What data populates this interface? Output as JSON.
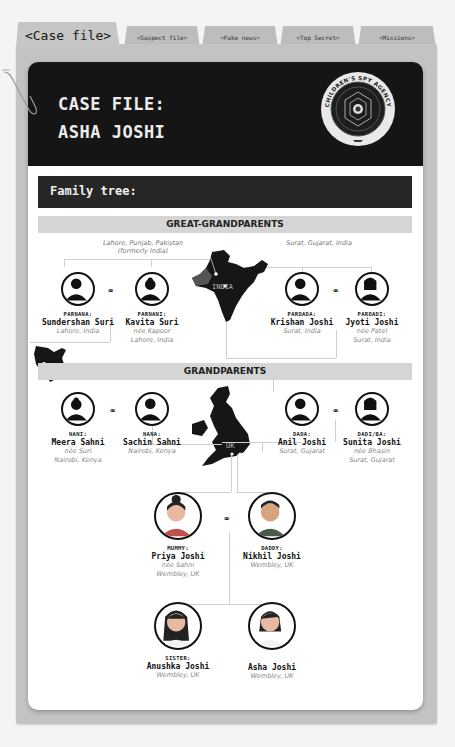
{
  "tabs": [
    {
      "label": "<Case file>",
      "active": true
    },
    {
      "label": "<Suspect file>",
      "active": false
    },
    {
      "label": "<Fake news>",
      "active": false
    },
    {
      "label": "<Top Secret>",
      "active": false
    },
    {
      "label": "<Missions>",
      "active": false
    }
  ],
  "header": {
    "line1": "CASE FILE:",
    "line2": "ASHA JOSHI",
    "badge_top_text": "CHILDREN'S SPY AGENCY",
    "badge_bottom_left": "QUESTION",
    "badge_bottom_right": "EVERYTHING"
  },
  "section_title": "Family tree:",
  "generations": {
    "great_grandparents": "GREAT-GRANDPARENTS",
    "grandparents": "GRANDPARENTS"
  },
  "origins": {
    "suri_great": "Lahore, Punjab, Pakistan",
    "suri_great_note": "(formerly India)",
    "joshi_great": "Surat, Gujarat, India"
  },
  "maps": {
    "india": "INDIA",
    "uk": "UK",
    "kenya": ""
  },
  "people": {
    "parnana": {
      "role": "PARNANA:",
      "name": "Sundershan Suri",
      "lines": [
        "Lahore, India"
      ]
    },
    "parnani": {
      "role": "PARNANI:",
      "name": "Kavita Suri",
      "lines": [
        "née Kapoor",
        "Lahore, India"
      ]
    },
    "pardada": {
      "role": "PARDADA:",
      "name": "Krishan Joshi",
      "lines": [
        "Surat, India"
      ]
    },
    "pardadi": {
      "role": "PARDADI:",
      "name": "Jyoti Joshi",
      "lines": [
        "née Patel",
        "Surat, India"
      ]
    },
    "nani": {
      "role": "NANI:",
      "name": "Meera Sahni",
      "lines": [
        "née Suri",
        "Nairobi, Kenya"
      ]
    },
    "nana": {
      "role": "NANA:",
      "name": "Sachin Sahni",
      "lines": [
        "Nairobi, Kenya"
      ]
    },
    "dada": {
      "role": "DADA:",
      "name": "Anil Joshi",
      "lines": [
        "Surat, Gujarat"
      ]
    },
    "dadi": {
      "role": "DADI/BA:",
      "name": "Sunita Joshi",
      "lines": [
        "née Bhasin",
        "Surat, Gujarat"
      ]
    },
    "mummy": {
      "role": "MUMMY:",
      "name": "Priya Joshi",
      "lines": [
        "née Sahni",
        "Wembley, UK"
      ]
    },
    "daddy": {
      "role": "DADDY:",
      "name": "Nikhil Joshi",
      "lines": [
        "Wembley, UK"
      ]
    },
    "sister": {
      "role": "SISTER:",
      "name": "Anushka Joshi",
      "lines": [
        "Wembley, UK"
      ]
    },
    "self": {
      "role": "",
      "name": "Asha Joshi",
      "lines": [
        "Wembley, UK"
      ]
    }
  },
  "marriage_symbol": "⚭",
  "colors": {
    "header_bg": "#151515",
    "folder_bg": "#c3c3c1",
    "gen_bar": "#d5d5d5"
  }
}
